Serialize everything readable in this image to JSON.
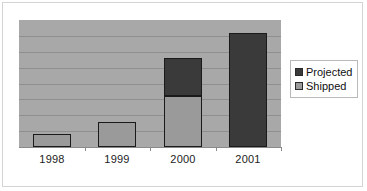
{
  "chart_data": {
    "type": "bar",
    "subtype": "stacked-column",
    "title": "",
    "subtitle": "",
    "xlabel": "",
    "ylabel": "",
    "categories": [
      "1998",
      "1999",
      "2000",
      "2001"
    ],
    "series": [
      {
        "name": "Shipped",
        "values": [
          1,
          2,
          4,
          0
        ],
        "color": "#9a9a9a"
      },
      {
        "name": "Projected",
        "values": [
          0,
          0,
          3,
          9
        ],
        "color": "#3a3a3a"
      }
    ],
    "totals": [
      1,
      2,
      7,
      9
    ],
    "ylim": [
      0,
      10
    ],
    "yticks": [
      0,
      1,
      2,
      3,
      4,
      5,
      6,
      7,
      8,
      9,
      10
    ],
    "ytick_labels_visible": false,
    "gridlines": {
      "horizontal": true,
      "vertical": false,
      "count": 7,
      "color": "#8f8f8f"
    },
    "plot_background": "#a8a8a8",
    "legend": {
      "position": "right",
      "entries": [
        "Projected",
        "Shipped"
      ]
    }
  },
  "legend": {
    "items": [
      {
        "label": "Projected",
        "swatch": "legend-swatch-projected"
      },
      {
        "label": "Shipped",
        "swatch": "legend-swatch-shipped"
      }
    ]
  },
  "axis": {
    "x_labels": [
      "1998",
      "1999",
      "2000",
      "2001"
    ]
  },
  "bars": [
    {
      "category": "1998",
      "shipped": 1,
      "projected": 0
    },
    {
      "category": "1999",
      "shipped": 2,
      "projected": 0
    },
    {
      "category": "2000",
      "shipped": 4,
      "projected": 3
    },
    {
      "category": "2001",
      "shipped": 0,
      "projected": 9
    }
  ]
}
